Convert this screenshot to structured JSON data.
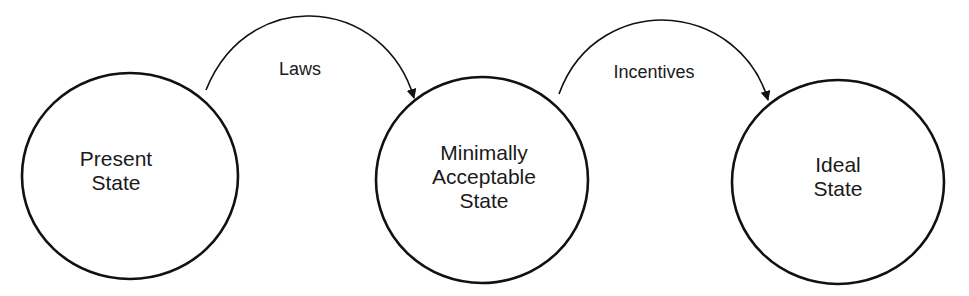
{
  "diagram": {
    "type": "state-transition",
    "nodes": [
      {
        "id": "present",
        "lines": [
          "Present",
          "State"
        ]
      },
      {
        "id": "minimal",
        "lines": [
          "Minimally",
          "Acceptable",
          "State"
        ]
      },
      {
        "id": "ideal",
        "lines": [
          "Ideal",
          "State"
        ]
      }
    ],
    "edges": [
      {
        "from": "present",
        "to": "minimal",
        "label": "Laws"
      },
      {
        "from": "minimal",
        "to": "ideal",
        "label": "Incentives"
      }
    ],
    "colors": {
      "stroke": "#111111",
      "text": "#1a1a1a",
      "background": "#ffffff"
    }
  }
}
